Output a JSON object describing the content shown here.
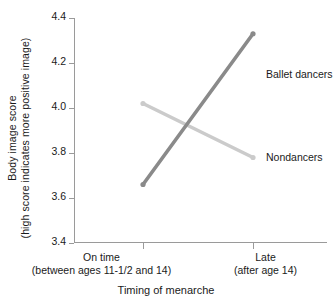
{
  "chart_data": {
    "type": "line",
    "title": "",
    "xlabel": "Timing of menarche",
    "ylabel": "Body image score",
    "ylabel_line1": "Body image score",
    "ylabel_line2": "(high score indicates more positive image)",
    "categories": [
      "On time",
      "Late"
    ],
    "category_sublabels": [
      "(between ages 11-1/2 and 14)",
      "(after age 14)"
    ],
    "ylim": [
      3.4,
      4.4
    ],
    "yticks": [
      "4.4",
      "4.2",
      "4.0",
      "3.8",
      "3.6",
      "3.4"
    ],
    "ytick_values": [
      4.4,
      4.2,
      4.0,
      3.8,
      3.6,
      3.4
    ],
    "grid": false,
    "legend_position": "inline-right",
    "series": [
      {
        "name": "Ballet dancers",
        "values": [
          3.66,
          4.33
        ],
        "color": "#8a8a8a"
      },
      {
        "name": "Nondancers",
        "values": [
          4.02,
          3.78
        ],
        "color": "#cbcbcb"
      }
    ]
  },
  "axis": {
    "color": "#9a9a9a"
  }
}
